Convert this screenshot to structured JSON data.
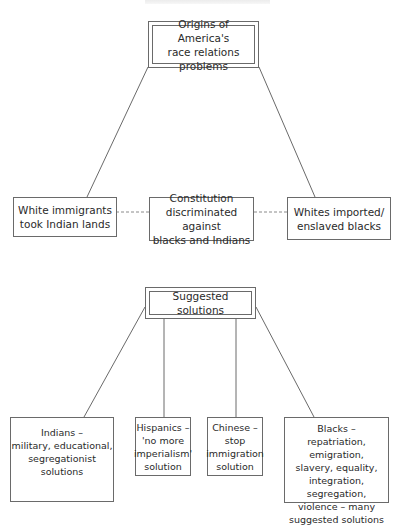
{
  "diagram": {
    "header_text": "",
    "origins": {
      "title_lines": [
        "Origins of America's",
        "race relations problems"
      ],
      "causes": [
        {
          "lines": [
            "White immigrants",
            "took Indian lands"
          ]
        },
        {
          "lines": [
            "Constitution",
            "discriminated against",
            "blacks and Indians"
          ]
        },
        {
          "lines": [
            "Whites imported/",
            "enslaved blacks"
          ]
        }
      ]
    },
    "solutions": {
      "title": "Suggested solutions",
      "groups": [
        {
          "lines": [
            "Indians –",
            "military, educational,",
            "segregationist solutions"
          ]
        },
        {
          "lines": [
            "Hispanics –",
            "'no more",
            "imperialism'",
            "solution"
          ]
        },
        {
          "lines": [
            "Chinese –",
            "stop",
            "immigration",
            "solution"
          ]
        },
        {
          "lines": [
            "Blacks –",
            "repatriation, emigration,",
            "slavery, equality,",
            "integration, segregation,",
            "violence – many",
            "suggested solutions"
          ]
        }
      ]
    },
    "colors": {
      "stroke": "#6a6a6a",
      "text": "#2a2a2a",
      "background": "#ffffff"
    }
  }
}
